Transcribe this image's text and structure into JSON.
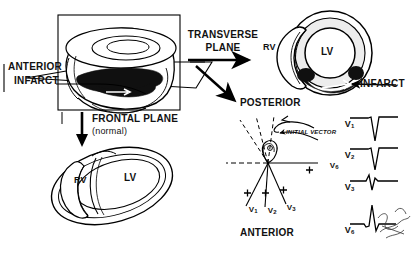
{
  "figure": {
    "ink_color": "#000000",
    "paper_color": "#ffffff",
    "fill_infarct": "#101010",
    "fill_muscle": "#e9e9e9"
  },
  "labels": {
    "anterior_infarct_line1": "ANTERIOR",
    "anterior_infarct_line2": "INFARCT",
    "transverse_plane_line1": "TRANSVERSE",
    "transverse_plane_line2": "PLANE",
    "frontal_plane": "FRONTAL PLANE",
    "frontal_plane_note": "(normal)",
    "posterior": "POSTERIOR",
    "anterior": "ANTERIOR",
    "initial_vector": "INITIAL VECTOR",
    "infarct": "INFARCT",
    "rv_transverse": "RV",
    "lv_transverse": "LV",
    "rv_frontal": "RV",
    "lv_frontal": "LV",
    "signature": "J. Kowalski"
  },
  "vector_diagram": {
    "axis_leads": [
      {
        "name": "V",
        "sub": "1",
        "polarity": "+"
      },
      {
        "name": "V",
        "sub": "2",
        "polarity": "+"
      },
      {
        "name": "V",
        "sub": "3",
        "polarity": "+"
      },
      {
        "name": "V",
        "sub": "6",
        "polarity": "+"
      }
    ],
    "orientation_top": "POSTERIOR",
    "orientation_bottom": "ANTERIOR",
    "loop_annotation": "INITIAL VECTOR"
  },
  "ecg_traces": [
    {
      "lead": "V",
      "sub": "1",
      "morphology": "QS complex (deep negative deflection)"
    },
    {
      "lead": "V",
      "sub": "2",
      "morphology": "QS complex (deep negative deflection)"
    },
    {
      "lead": "V",
      "sub": "3",
      "morphology": "rS / small biphasic complex"
    },
    {
      "lead": "V",
      "sub": "6",
      "morphology": "tall R wave with small q and s"
    }
  ]
}
